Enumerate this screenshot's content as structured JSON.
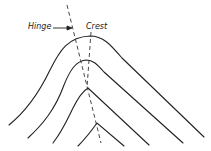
{
  "diagram": {
    "labels": {
      "hinge": "Hinge",
      "crest": "Crest"
    },
    "line_color": "#222222",
    "folds": [
      {
        "name": "fold-layer-1"
      },
      {
        "name": "fold-layer-2"
      },
      {
        "name": "fold-layer-3"
      },
      {
        "name": "fold-layer-4"
      }
    ]
  }
}
